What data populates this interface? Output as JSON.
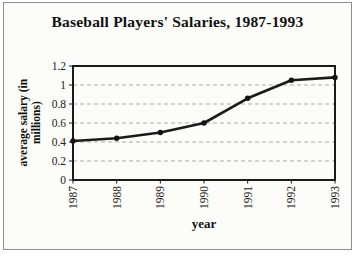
{
  "panel": {
    "background": "#fcfcf8",
    "border_color": "#8e8e8e"
  },
  "chart_data": {
    "type": "line",
    "title": "Baseball Players' Salaries, 1987-1993",
    "xlabel": "year",
    "ylabel": "average salary (in millions)",
    "ylabel_lines": [
      "average salary (in",
      "millions)"
    ],
    "categories": [
      "1987",
      "1988",
      "1989",
      "1990",
      "1991",
      "1992",
      "1993"
    ],
    "values": [
      0.41,
      0.44,
      0.5,
      0.6,
      0.86,
      1.05,
      1.08
    ],
    "ylim": [
      0,
      1.2
    ],
    "ytick_step": 0.2,
    "ytick_labels": [
      "0",
      "0.2",
      "0.4",
      "0.6",
      "0.8",
      "1",
      "1.2"
    ],
    "grid": "horizontal-dashed",
    "legend": "none",
    "line_color": "#1a1a1a",
    "marker_color": "#111111",
    "grid_color": "#aaaaaa",
    "axis_color": "#1a1a1a",
    "tick_label_color": "#222222"
  }
}
